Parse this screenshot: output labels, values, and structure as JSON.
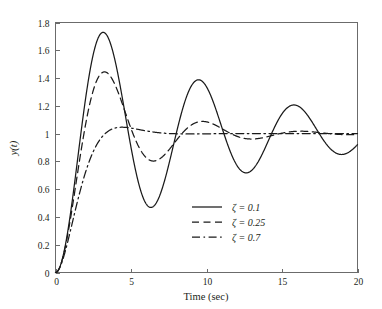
{
  "chart_data": {
    "type": "line",
    "title": "",
    "xlabel": "Time (sec)",
    "ylabel": "y(t)",
    "xlim": [
      0,
      20
    ],
    "ylim": [
      0,
      1.8
    ],
    "xticks": [
      "0",
      "5",
      "10",
      "15",
      "20"
    ],
    "xtick_values": [
      0,
      5,
      10,
      15,
      20
    ],
    "yticks": [
      "0",
      "0.2",
      "0.4",
      "0.6",
      "0.8",
      "1",
      "1.2",
      "1.4",
      "1.6",
      "1.8"
    ],
    "ytick_values": [
      0,
      0.2,
      0.4,
      0.6,
      0.8,
      1.0,
      1.2,
      1.4,
      1.6,
      1.8
    ],
    "grid": false,
    "legend_position": "center-right-lower",
    "natural_frequency": 1.0,
    "series": [
      {
        "name": "ζ = 0.1",
        "damping_ratio": 0.1,
        "line_style": "solid",
        "color": "#1a1a1a",
        "peaks": [
          {
            "t": 3.16,
            "y": 1.73
          },
          {
            "t": 9.47,
            "y": 1.4
          },
          {
            "t": 15.8,
            "y": 1.21
          }
        ],
        "valleys": [
          {
            "t": 6.31,
            "y": 0.47
          },
          {
            "t": 12.6,
            "y": 0.73
          },
          {
            "t": 18.9,
            "y": 0.86
          }
        ],
        "final_value": 1.0
      },
      {
        "name": "ζ = 0.25",
        "damping_ratio": 0.25,
        "line_style": "dashed",
        "color": "#1a1a1a",
        "peaks": [
          {
            "t": 3.24,
            "y": 1.44
          },
          {
            "t": 9.73,
            "y": 1.07
          }
        ],
        "valleys": [
          {
            "t": 6.49,
            "y": 0.81
          },
          {
            "t": 13.0,
            "y": 0.97
          }
        ],
        "final_value": 1.0
      },
      {
        "name": "ζ = 0.7",
        "damping_ratio": 0.7,
        "line_style": "dashdot",
        "color": "#1a1a1a",
        "peaks": [
          {
            "t": 4.4,
            "y": 1.046
          }
        ],
        "valleys": [],
        "final_value": 1.0
      }
    ]
  },
  "legend": {
    "entries": [
      {
        "label": "ζ = 0.1",
        "style": "solid"
      },
      {
        "label": "ζ = 0.25",
        "style": "dashed"
      },
      {
        "label": "ζ = 0.7",
        "style": "dashdot"
      }
    ]
  },
  "axes": {
    "x_title": "Time (sec)",
    "y_title": "y(t)"
  }
}
